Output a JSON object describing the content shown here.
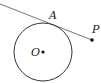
{
  "diagram": {
    "type": "geometry",
    "labels": {
      "tangent_point": "A",
      "center": "O",
      "external_point": "P"
    },
    "colors": {
      "stroke": "#333333",
      "line": "#555555",
      "point": "#111111"
    }
  }
}
